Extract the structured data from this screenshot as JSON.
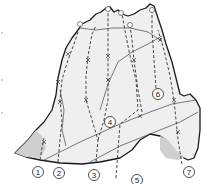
{
  "diagram": {
    "type": "climbing-topo",
    "routes": [
      {
        "id": 1,
        "label": "1"
      },
      {
        "id": 2,
        "label": "2"
      },
      {
        "id": 3,
        "label": "3"
      },
      {
        "id": 4,
        "label": "4"
      },
      {
        "id": 5,
        "label": "5"
      },
      {
        "id": 6,
        "label": "6"
      },
      {
        "id": 7,
        "label": "7"
      }
    ],
    "colors": {
      "rock_fill": "#efefef",
      "outline": "#1a1a1a",
      "route_line": "#333333",
      "shadow": "#cfcfcf",
      "background": "#ffffff"
    }
  }
}
